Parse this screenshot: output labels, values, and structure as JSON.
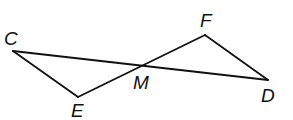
{
  "diagram": {
    "type": "geometry",
    "points": {
      "C": {
        "label": "C",
        "x": 13,
        "y": 51
      },
      "E": {
        "label": "E",
        "x": 78,
        "y": 97
      },
      "M": {
        "label": "M",
        "x": 140,
        "y": 67
      },
      "F": {
        "label": "F",
        "x": 205,
        "y": 35
      },
      "D": {
        "label": "D",
        "x": 268,
        "y": 80
      }
    },
    "segments": [
      "CD",
      "EF",
      "CE",
      "FD"
    ],
    "labels": {
      "C": "C",
      "E": "E",
      "M": "M",
      "F": "F",
      "D": "D"
    }
  }
}
